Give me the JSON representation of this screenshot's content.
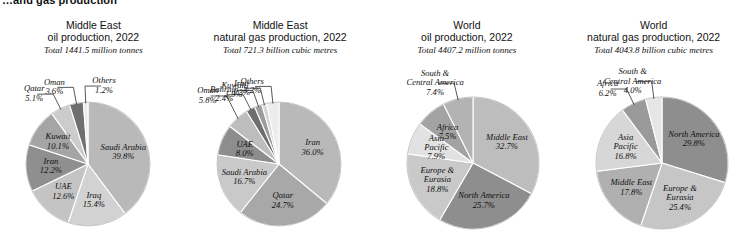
{
  "page": {
    "title": "…and gas production"
  },
  "charts": [
    {
      "id": "middle-east-oil",
      "title_line1": "Middle East",
      "title_line2": "oil production, 2022",
      "total": "Total 1441.5 million tonnes",
      "cx": 88,
      "cy": 164,
      "r": 62,
      "start_angle": -90,
      "chart_data": {
        "type": "pie",
        "title": "Middle East oil production, 2022",
        "total_label": "Total 1441.5 million tonnes",
        "total_value": 1441.5,
        "units": "million tonnes",
        "labels": [
          "Saudi Arabia",
          "Iraq",
          "UAE",
          "Iran",
          "Kuwait",
          "Qatar",
          "Oman",
          "Others"
        ],
        "values": [
          39.8,
          15.4,
          12.6,
          12.2,
          10.1,
          5.1,
          3.6,
          1.2
        ],
        "value_labels": [
          "39.8%",
          "15.4%",
          "12.6%",
          "12.2%",
          "10.1%",
          "5.1%",
          "3.6%",
          "1.2%"
        ],
        "colors": [
          "#b9b9b9",
          "#d2d2d2",
          "#c4c4c4",
          "#8f8f8f",
          "#a5a5a5",
          "#cccccc",
          "#6f6f6f",
          "#ebebeb"
        ],
        "label_placement": [
          "in",
          "in",
          "in",
          "in",
          "in",
          "out",
          "out",
          "out"
        ]
      }
    },
    {
      "id": "middle-east-gas",
      "title_line1": "Middle East",
      "title_line2": "natural gas production, 2022",
      "total": "Total 721.3 billion cubic metres",
      "cx": 279,
      "cy": 164,
      "r": 62,
      "start_angle": -90,
      "chart_data": {
        "type": "pie",
        "title": "Middle East natural gas production, 2022",
        "total_label": "Total 721.3 billion cubic metres",
        "total_value": 721.3,
        "units": "billion cubic metres",
        "labels": [
          "Iran",
          "Qatar",
          "Saudi Arabia",
          "UAE",
          "Oman",
          "Bahrain",
          "Kuwait",
          "Iraq",
          "Others"
        ],
        "values": [
          36.0,
          24.7,
          16.7,
          8.0,
          5.8,
          2.4,
          1.9,
          1.3,
          3.2
        ],
        "value_labels": [
          "36.0%",
          "24.7%",
          "16.7%",
          "8.0%",
          "5.8%",
          "2.4%",
          "1.9%",
          "1.3%",
          "3.2%"
        ],
        "colors": [
          "#b9b9b9",
          "#a8a8a8",
          "#c9c9c9",
          "#8d8d8d",
          "#bdbdbd",
          "#6e6e6e",
          "#9c9c9c",
          "#d6d6d6",
          "#ececec"
        ],
        "label_placement": [
          "in",
          "in",
          "in",
          "in",
          "out",
          "out",
          "out",
          "out",
          "out"
        ]
      }
    },
    {
      "id": "world-oil",
      "title_line1": "World",
      "title_line2": "oil production, 2022",
      "total": "Total 4407.2 million tonnes",
      "cx": 473,
      "cy": 163,
      "r": 66,
      "start_angle": -90,
      "chart_data": {
        "type": "pie",
        "title": "World oil production, 2022",
        "total_label": "Total 4407.2 million tonnes",
        "total_value": 4407.2,
        "units": "million tonnes",
        "labels": [
          "Middle East",
          "North America",
          "Europe & Eurasia",
          "Asia Pacific",
          "Africa",
          "South & Central America"
        ],
        "values": [
          32.7,
          25.7,
          18.8,
          7.9,
          7.5,
          7.4
        ],
        "value_labels": [
          "32.7%",
          "25.7%",
          "18.8%",
          "7.9%",
          "7.5%",
          "7.4%"
        ],
        "colors": [
          "#bdbdbd",
          "#8e8e8e",
          "#c9c9c9",
          "#e2e2e2",
          "#a3a3a3",
          "#b3b3b3"
        ],
        "label_placement": [
          "in",
          "in",
          "in",
          "in",
          "in",
          "out"
        ]
      }
    },
    {
      "id": "world-gas",
      "title_line1": "World",
      "title_line2": "natural gas production, 2022",
      "total": "Total 4043.8 billion cubic metres",
      "cx": 662,
      "cy": 163,
      "r": 66,
      "start_angle": -90,
      "chart_data": {
        "type": "pie",
        "title": "World natural gas production, 2022",
        "total_label": "Total 4043.8 billion cubic metres",
        "total_value": 4043.8,
        "units": "billion cubic metres",
        "labels": [
          "North America",
          "Europe & Eurasia",
          "Middle East",
          "Asia Pacific",
          "Africa",
          "South & Central America"
        ],
        "values": [
          29.8,
          25.4,
          17.8,
          16.8,
          6.2,
          4.0
        ],
        "value_labels": [
          "29.8%",
          "25.4%",
          "17.8%",
          "16.8%",
          "6.2%",
          "4.0%"
        ],
        "colors": [
          "#8e8e8e",
          "#c6c6c6",
          "#b0b0b0",
          "#d7d7d7",
          "#9a9a9a",
          "#e6e6e6"
        ],
        "label_placement": [
          "in",
          "in",
          "in",
          "in",
          "out",
          "out"
        ]
      }
    }
  ]
}
